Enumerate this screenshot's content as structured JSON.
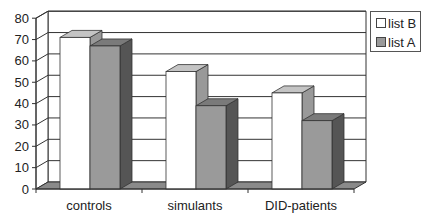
{
  "chart_data": {
    "type": "bar",
    "style": "3d-clustered-column",
    "title": "",
    "xlabel": "",
    "ylabel": "",
    "categories": [
      "controls",
      "simulants",
      "DID-patients"
    ],
    "series": [
      {
        "name": "list B",
        "values": [
          71,
          55,
          45
        ],
        "color": "#ffffff",
        "side_color": "#999999",
        "top_color": "#c4c4c4"
      },
      {
        "name": "list A",
        "values": [
          67,
          39,
          32
        ],
        "color": "#9a9a9a",
        "side_color": "#555555",
        "top_color": "#7a7a7a"
      }
    ],
    "ylim": [
      0,
      80
    ],
    "yticks": [
      0,
      10,
      20,
      30,
      40,
      50,
      60,
      70,
      80
    ],
    "grid": true,
    "legend_position": "right-top",
    "legend": [
      "list B",
      "list A"
    ]
  },
  "colors": {
    "floor": "#8a8a8a",
    "grid": "#333333",
    "axis": "#333333"
  }
}
